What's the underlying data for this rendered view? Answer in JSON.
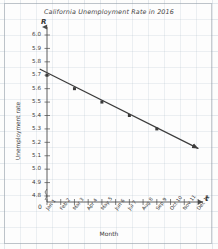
{
  "chart_data": {
    "type": "line",
    "title": "California Unemployment Rate in 2016",
    "xlabel": "Month",
    "ylabel": "Unemployment rate",
    "x_axis_symbol": "t",
    "y_axis_symbol": "R",
    "origin_label": "0",
    "grid": true,
    "legend": null,
    "ylim": [
      4.8,
      6.0
    ],
    "y_ticks": [
      "6.0",
      "5.9",
      "5.8",
      "5.7",
      "5.6",
      "5.5",
      "5.4",
      "5.3",
      "5.2",
      "5.1",
      "5.0",
      "4.9",
      "4.8"
    ],
    "y_tick_values": [
      6.0,
      5.9,
      5.8,
      5.7,
      5.6,
      5.5,
      5.4,
      5.3,
      5.2,
      5.1,
      5.0,
      4.9,
      4.8
    ],
    "categories": [
      "Jan 1",
      "Feb 2",
      "Mar 3",
      "Apr 4",
      "May 5",
      "Jun 6",
      "Jul 7",
      "Aug 8",
      "Sep 9",
      "Oct 10",
      "Nov 11",
      "Dec 12"
    ],
    "x": [
      1,
      2,
      3,
      4,
      5,
      6,
      7,
      8,
      9,
      10,
      11,
      12
    ],
    "xlim": [
      1,
      12
    ],
    "series": [
      {
        "name": "Unemployment rate",
        "color": "#3c3c3c",
        "values": [
          5.7,
          5.65,
          5.6,
          5.55,
          5.5,
          5.45,
          5.4,
          5.35,
          5.3,
          5.25,
          5.2,
          5.15
        ],
        "marker_points": [
          {
            "x": 1,
            "y": 5.7,
            "label": "Jan 1"
          },
          {
            "x": 3,
            "y": 5.6,
            "label": "Mar 3"
          },
          {
            "x": 5,
            "y": 5.5,
            "label": "May 5"
          },
          {
            "x": 7,
            "y": 5.4,
            "label": "Jul 7"
          },
          {
            "x": 9,
            "y": 5.3,
            "label": "Sep 9"
          }
        ],
        "line_start": {
          "x": 0.5,
          "y": 5.745
        },
        "line_end": {
          "x": 12.0,
          "y": 5.155
        },
        "has_arrowhead": true
      }
    ]
  }
}
